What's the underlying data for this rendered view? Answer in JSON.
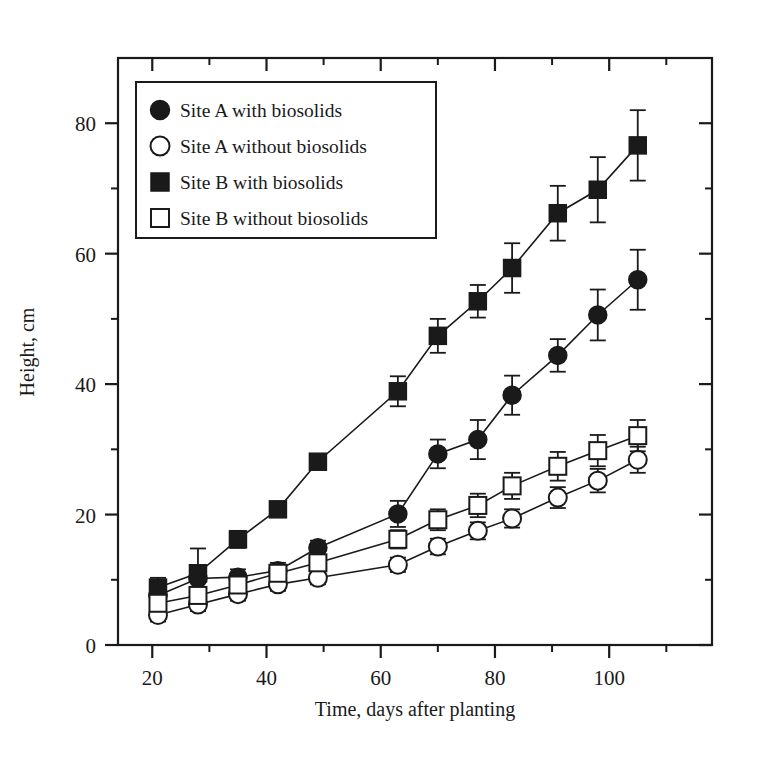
{
  "chart_data": {
    "type": "line",
    "title": "",
    "subtitle": "",
    "xlabel": "Time, days after planting",
    "ylabel": "Height, cm",
    "xlim": [
      14,
      118
    ],
    "ylim": [
      0,
      90
    ],
    "grid": false,
    "legend_position": "top-left-inside",
    "x_ticks_major": [
      20,
      40,
      60,
      80,
      100
    ],
    "x_ticks_minor": [
      30,
      50,
      70,
      90,
      110
    ],
    "x_tick_labels": [
      "20",
      "40",
      "60",
      "80",
      "100"
    ],
    "y_ticks_major": [
      0,
      20,
      40,
      60,
      80
    ],
    "y_ticks_minor": [
      10,
      30,
      50,
      70
    ],
    "y_tick_labels": [
      "0",
      "20",
      "40",
      "60",
      "80"
    ],
    "x": [
      21,
      28,
      35,
      42,
      49,
      63,
      70,
      77,
      83,
      91,
      98,
      105
    ],
    "series": [
      {
        "name": "Site A with biosolids",
        "marker": "filled-circle",
        "color": "#1a1a1a",
        "values": [
          7.6,
          10.2,
          10.4,
          11.4,
          14.9,
          20.1,
          29.3,
          31.5,
          38.3,
          44.4,
          50.6,
          56.0
        ],
        "errors": [
          1.6,
          1.5,
          1.2,
          1.2,
          1.1,
          2.0,
          2.2,
          3.0,
          3.0,
          2.5,
          3.9,
          4.6
        ]
      },
      {
        "name": "Site A without biosolids",
        "marker": "open-circle",
        "color": "#1a1a1a",
        "values": [
          4.6,
          6.2,
          7.8,
          9.3,
          10.3,
          12.3,
          15.1,
          17.5,
          19.4,
          22.6,
          25.2,
          28.4
        ],
        "errors": [
          1.0,
          1.0,
          1.0,
          1.0,
          1.0,
          1.1,
          1.2,
          1.3,
          1.4,
          1.6,
          1.8,
          2.0
        ]
      },
      {
        "name": "Site B with biosolids",
        "marker": "filled-square",
        "color": "#1a1a1a",
        "values": [
          8.8,
          11.0,
          16.2,
          20.8,
          28.1,
          38.9,
          47.4,
          52.7,
          57.8,
          66.2,
          69.8,
          76.6
        ],
        "errors": [
          1.5,
          3.8,
          1.3,
          1.0,
          1.0,
          2.3,
          2.6,
          2.5,
          3.8,
          4.2,
          5.0,
          5.4
        ]
      },
      {
        "name": "Site B without biosolids",
        "marker": "open-square",
        "color": "#1a1a1a",
        "values": [
          6.4,
          7.6,
          9.2,
          11.0,
          12.6,
          16.2,
          19.2,
          21.4,
          24.4,
          27.4,
          29.8,
          32.1
        ],
        "errors": [
          1.2,
          1.1,
          1.1,
          1.1,
          1.1,
          1.4,
          1.6,
          1.8,
          2.0,
          2.2,
          2.4,
          2.4
        ]
      }
    ],
    "legend": [
      "Site A with biosolids",
      "Site A without biosolids",
      "Site B with biosolids",
      "Site B without biosolids"
    ]
  }
}
